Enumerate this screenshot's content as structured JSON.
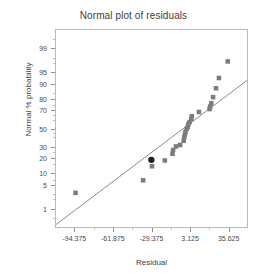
{
  "chart_data": {
    "type": "scatter",
    "title": "Normal plot of residuals",
    "xlabel": "Residual",
    "ylabel": "Normal % probability",
    "grid": false,
    "legend": null,
    "xlim": [
      -110.625,
      51.875
    ],
    "xticks": [
      -94.375,
      -61.875,
      -29.375,
      3.125,
      35.625
    ],
    "xtick_labels": [
      "-94.375",
      "-61.875",
      "-29.375",
      "3.125",
      "35.625"
    ],
    "yscale": "normal-probability",
    "yticks": [
      1,
      5,
      10,
      20,
      30,
      50,
      70,
      80,
      90,
      95,
      99
    ],
    "ytick_labels": [
      "1",
      "5",
      "10",
      "20",
      "30",
      "50",
      "70",
      "80",
      "90",
      "95",
      "99"
    ],
    "ylim": [
      0.2,
      99.8
    ],
    "series": [
      {
        "name": "residuals",
        "marker": "square",
        "color": "#7c7c7c",
        "points": [
          {
            "x": -94.0,
            "y": 3.0
          },
          {
            "x": -36.5,
            "y": 6.5
          },
          {
            "x": -29.0,
            "y": 13.5
          },
          {
            "x": -18.0,
            "y": 17.5
          },
          {
            "x": -11.5,
            "y": 23.0
          },
          {
            "x": -11.0,
            "y": 26.5
          },
          {
            "x": -8.5,
            "y": 30.0
          },
          {
            "x": -5.0,
            "y": 31.5
          },
          {
            "x": -2.0,
            "y": 36.0
          },
          {
            "x": -1.5,
            "y": 40.0
          },
          {
            "x": -1.0,
            "y": 43.0
          },
          {
            "x": -0.5,
            "y": 46.0
          },
          {
            "x": 0.5,
            "y": 49.5
          },
          {
            "x": 1.5,
            "y": 52.0
          },
          {
            "x": 2.0,
            "y": 55.0
          },
          {
            "x": 3.0,
            "y": 57.5
          },
          {
            "x": 4.5,
            "y": 61.0
          },
          {
            "x": 5.0,
            "y": 64.0
          },
          {
            "x": 11.0,
            "y": 68.5
          },
          {
            "x": 20.0,
            "y": 71.5
          },
          {
            "x": 20.5,
            "y": 74.0
          },
          {
            "x": 21.5,
            "y": 77.0
          },
          {
            "x": 23.0,
            "y": 82.0
          },
          {
            "x": 25.5,
            "y": 88.0
          },
          {
            "x": 28.0,
            "y": 93.0
          },
          {
            "x": 35.5,
            "y": 97.5
          }
        ]
      },
      {
        "name": "highlighted-residual",
        "marker": "circle",
        "color": "#1f1f1f",
        "points": [
          {
            "x": -29.5,
            "y": 18.0
          }
        ]
      }
    ],
    "reference_line": {
      "name": "normal-reference-line",
      "color": "#8a8a8a",
      "from": {
        "x": -110.625,
        "y": 0.25
      },
      "to": {
        "x": 51.875,
        "y": 92.0
      }
    }
  }
}
